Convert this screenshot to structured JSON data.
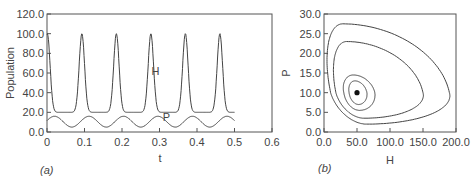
{
  "chart_data": [
    {
      "type": "line",
      "panel_label": "(a)",
      "panel_letter": "a",
      "xlabel": "t",
      "ylabel": "Population",
      "xlim": [
        0,
        0.6
      ],
      "ylim": [
        0,
        120
      ],
      "xticks": [
        "0",
        "0.1",
        "0.2",
        "0.3",
        "0.4",
        "0.5",
        "0.6"
      ],
      "yticks": [
        "0.0",
        "20.0",
        "40.0",
        "60.0",
        "80.0",
        "100.0",
        "120.0"
      ],
      "grid": false,
      "series": [
        {
          "name": "H",
          "label_pos": {
            "x": 0.3,
            "y": 62
          },
          "period": 0.092,
          "max": 100,
          "min": 20,
          "first_peak": 0.093,
          "x": [
            0,
            0.045,
            0.093,
            0.138,
            0.185,
            0.23,
            0.278,
            0.322,
            0.37,
            0.414,
            0.46,
            0.5
          ],
          "values": [
            100,
            20,
            100,
            20,
            100,
            20,
            100,
            20,
            100,
            20,
            100,
            20
          ]
        },
        {
          "name": "P",
          "label_pos": {
            "x": 0.33,
            "y": 15
          },
          "period": 0.092,
          "max": 16,
          "min": 5,
          "x": [
            0,
            0.02,
            0.07,
            0.112,
            0.16,
            0.205,
            0.25,
            0.298,
            0.345,
            0.39,
            0.44,
            0.483,
            0.5
          ],
          "values": [
            11,
            16,
            5,
            16,
            5,
            16,
            5,
            16,
            5,
            16,
            5,
            16,
            12
          ]
        }
      ]
    },
    {
      "type": "line",
      "panel_label": "(b)",
      "panel_letter": "b",
      "xlabel": "H",
      "ylabel": "P",
      "xlim": [
        0,
        200
      ],
      "ylim": [
        0,
        30
      ],
      "xticks": [
        "0.0",
        "50.0",
        "100.0",
        "150.0",
        "200.0"
      ],
      "yticks": [
        "0.0",
        "5.0",
        "10.0",
        "15.0",
        "20.0",
        "25.0",
        "30.0"
      ],
      "grid": false,
      "equilibrium_point": {
        "H": 50,
        "P": 10
      },
      "series": [
        {
          "name": "orbit-1",
          "description": "closed orbit",
          "H_range": [
            38,
            65
          ],
          "P_range": [
            7,
            13
          ]
        },
        {
          "name": "orbit-2",
          "description": "closed orbit",
          "H_range": [
            30,
            77
          ],
          "P_range": [
            5.5,
            14.5
          ]
        },
        {
          "name": "orbit-3",
          "description": "closed orbit",
          "H_range": [
            18,
            150
          ],
          "P_range": [
            3.5,
            23
          ]
        },
        {
          "name": "orbit-4",
          "description": "closed orbit",
          "H_range": [
            10,
            190
          ],
          "P_range": [
            2,
            27.5
          ]
        }
      ]
    }
  ]
}
